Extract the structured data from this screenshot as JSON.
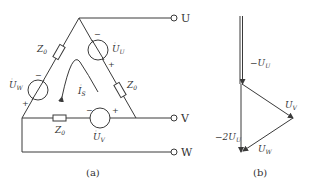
{
  "figure_a": {
    "caption": "(a)",
    "terminals": {
      "u": "U",
      "v": "V",
      "w": "W"
    },
    "sources": {
      "uu": {
        "main": "U",
        "sub": "U",
        "minus": "−",
        "plus": "+"
      },
      "uv": {
        "main": "U",
        "sub": "V",
        "minus": "−",
        "plus": "+"
      },
      "uw": {
        "main": "U",
        "sub": "W",
        "minus": "−",
        "plus": "+"
      }
    },
    "impedances": {
      "main": "Z",
      "sub": "0"
    },
    "current": {
      "main": "I",
      "sub": "S"
    }
  },
  "figure_b": {
    "caption": "(b)",
    "phasors": {
      "neg_uu": {
        "prefix": "−",
        "main": "U",
        "sub": "U"
      },
      "uv": {
        "main": "U",
        "sub": "V"
      },
      "uw": {
        "main": "U",
        "sub": "W"
      },
      "neg2_uu": {
        "prefix": "−2",
        "main": "U",
        "sub": "U"
      }
    }
  },
  "colors": {
    "line": "#3a3a3a",
    "background": "#ffffff"
  }
}
